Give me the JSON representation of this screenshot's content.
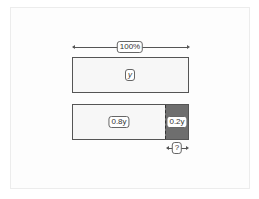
{
  "diagram": {
    "top_arrow_label": "100%",
    "top_bar_label": "y",
    "bottom_bar": {
      "left_label": "0.8y",
      "right_label": "0.2y"
    },
    "question_label": "?",
    "colors": {
      "bar_fill": "#f7f7f7",
      "dark_segment": "#6e6e6e",
      "border": "#555555"
    }
  }
}
